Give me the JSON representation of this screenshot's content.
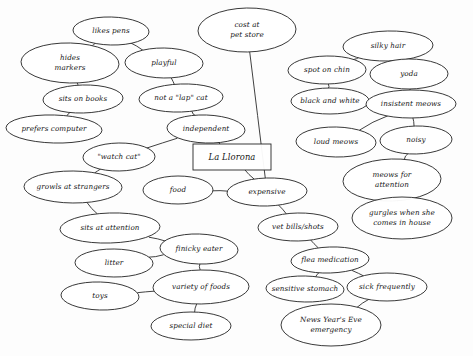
{
  "diagram": {
    "type": "mind-map",
    "style": "hand-drawn ink on paper",
    "background_color": "#fdfdfd",
    "ink_color": "#242424",
    "root": {
      "id": "la-llorona",
      "label": "La Llorona",
      "shape": "rectangle",
      "x": 232,
      "y": 157,
      "w": 78,
      "h": 26
    },
    "nodes": [
      {
        "id": "likes-pens",
        "label": "likes pens",
        "x": 111,
        "y": 31,
        "rx": 38,
        "ry": 14,
        "lines": [
          "likes pens"
        ]
      },
      {
        "id": "hides-markers",
        "label": "hides markers",
        "x": 70,
        "y": 63,
        "rx": 49,
        "ry": 20,
        "lines": [
          "hides",
          "markers"
        ]
      },
      {
        "id": "playful",
        "label": "playful",
        "x": 164,
        "y": 63,
        "rx": 39,
        "ry": 15,
        "lines": [
          "playful"
        ]
      },
      {
        "id": "cost-at-pet-store",
        "label": "cost at pet store",
        "x": 247,
        "y": 30,
        "rx": 49,
        "ry": 22,
        "lines": [
          "cost at",
          "pet store"
        ]
      },
      {
        "id": "silky-hair",
        "label": "silky hair",
        "x": 388,
        "y": 46,
        "rx": 45,
        "ry": 15,
        "lines": [
          "silky hair"
        ]
      },
      {
        "id": "spot-on-chin",
        "label": "spot on chin",
        "x": 327,
        "y": 70,
        "rx": 39,
        "ry": 14,
        "lines": [
          "spot on chin"
        ]
      },
      {
        "id": "yoda",
        "label": "yoda",
        "x": 409,
        "y": 74,
        "rx": 39,
        "ry": 15,
        "lines": [
          "yoda"
        ]
      },
      {
        "id": "sits-on-books",
        "label": "sits on books",
        "x": 83,
        "y": 99,
        "rx": 40,
        "ry": 14,
        "lines": [
          "sits on books"
        ]
      },
      {
        "id": "not-a-lap-cat",
        "label": "not a \"lap\" cat",
        "x": 181,
        "y": 98,
        "rx": 42,
        "ry": 14,
        "lines": [
          "not a \"lap\" cat"
        ]
      },
      {
        "id": "black-and-white",
        "label": "black and white",
        "x": 330,
        "y": 101,
        "rx": 39,
        "ry": 13,
        "lines": [
          "black and white"
        ]
      },
      {
        "id": "insistent-meows",
        "label": "insistent meows",
        "x": 411,
        "y": 104,
        "rx": 45,
        "ry": 14,
        "lines": [
          "insistent meows"
        ]
      },
      {
        "id": "prefers-computer",
        "label": "prefers computer",
        "x": 54,
        "y": 129,
        "rx": 48,
        "ry": 14,
        "lines": [
          "prefers computer"
        ]
      },
      {
        "id": "independent",
        "label": "independent",
        "x": 206,
        "y": 129,
        "rx": 39,
        "ry": 14,
        "lines": [
          "independent"
        ]
      },
      {
        "id": "loud-meows",
        "label": "loud meows",
        "x": 336,
        "y": 142,
        "rx": 40,
        "ry": 15,
        "lines": [
          "loud meows"
        ]
      },
      {
        "id": "noisy",
        "label": "noisy",
        "x": 416,
        "y": 140,
        "rx": 36,
        "ry": 14,
        "lines": [
          "noisy"
        ]
      },
      {
        "id": "watch-cat",
        "label": "\"watch cat\"",
        "x": 119,
        "y": 157,
        "rx": 36,
        "ry": 14,
        "lines": [
          "\"watch cat\""
        ]
      },
      {
        "id": "meows-for-attention",
        "label": "meows for attention",
        "x": 392,
        "y": 180,
        "rx": 49,
        "ry": 21,
        "lines": [
          "meows for",
          "attention"
        ]
      },
      {
        "id": "growls-at-strangers",
        "label": "growls at strangers",
        "x": 73,
        "y": 187,
        "rx": 49,
        "ry": 16,
        "lines": [
          "growls at strangers"
        ]
      },
      {
        "id": "food",
        "label": "food",
        "x": 178,
        "y": 190,
        "rx": 35,
        "ry": 14,
        "lines": [
          "food"
        ]
      },
      {
        "id": "expensive",
        "label": "expensive",
        "x": 267,
        "y": 192,
        "rx": 40,
        "ry": 14,
        "lines": [
          "expensive"
        ]
      },
      {
        "id": "vet-bills-shots",
        "label": "vet bills/shots",
        "x": 298,
        "y": 227,
        "rx": 40,
        "ry": 14,
        "lines": [
          "vet bills/shots"
        ]
      },
      {
        "id": "gurgles-when-she-comes",
        "label": "gurgles when she comes in house",
        "x": 402,
        "y": 218,
        "rx": 50,
        "ry": 21,
        "lines": [
          "gurgles when she",
          "comes in house"
        ]
      },
      {
        "id": "sits-at-attention",
        "label": "sits at attention",
        "x": 110,
        "y": 228,
        "rx": 50,
        "ry": 15,
        "lines": [
          "sits at attention"
        ]
      },
      {
        "id": "finicky-eater",
        "label": "finicky eater",
        "x": 199,
        "y": 249,
        "rx": 39,
        "ry": 15,
        "lines": [
          "finicky eater"
        ]
      },
      {
        "id": "flea-medication",
        "label": "flea medication",
        "x": 330,
        "y": 260,
        "rx": 39,
        "ry": 13,
        "lines": [
          "flea medication"
        ]
      },
      {
        "id": "litter",
        "label": "litter",
        "x": 114,
        "y": 263,
        "rx": 39,
        "ry": 14,
        "lines": [
          "litter"
        ]
      },
      {
        "id": "variety-of-foods",
        "label": "variety of foods",
        "x": 201,
        "y": 287,
        "rx": 48,
        "ry": 17,
        "lines": [
          "variety of foods"
        ]
      },
      {
        "id": "sensitive-stomach",
        "label": "sensitive stomach",
        "x": 305,
        "y": 289,
        "rx": 39,
        "ry": 13,
        "lines": [
          "sensitive stomach"
        ]
      },
      {
        "id": "sick-frequently",
        "label": "sick frequently",
        "x": 387,
        "y": 287,
        "rx": 40,
        "ry": 14,
        "lines": [
          "sick frequently"
        ]
      },
      {
        "id": "toys",
        "label": "toys",
        "x": 100,
        "y": 296,
        "rx": 39,
        "ry": 14,
        "lines": [
          "toys"
        ]
      },
      {
        "id": "special-diet",
        "label": "special diet",
        "x": 191,
        "y": 326,
        "rx": 40,
        "ry": 14,
        "lines": [
          "special diet"
        ]
      },
      {
        "id": "news-years-eve",
        "label": "News Year's Eve emergency",
        "x": 331,
        "y": 325,
        "rx": 50,
        "ry": 21,
        "lines": [
          "News Year's Eve",
          "emergency"
        ]
      }
    ],
    "edges": [
      {
        "from": "likes-pens",
        "to": "hides-markers"
      },
      {
        "from": "likes-pens",
        "to": "playful"
      },
      {
        "from": "hides-markers",
        "to": "sits-on-books"
      },
      {
        "from": "sits-on-books",
        "to": "prefers-computer"
      },
      {
        "from": "playful",
        "to": "not-a-lap-cat"
      },
      {
        "from": "not-a-lap-cat",
        "to": "independent"
      },
      {
        "from": "independent",
        "to": "la-llorona"
      },
      {
        "from": "independent",
        "to": "watch-cat"
      },
      {
        "from": "watch-cat",
        "to": "growls-at-strangers"
      },
      {
        "from": "growls-at-strangers",
        "to": "sits-at-attention"
      },
      {
        "from": "sits-at-attention",
        "to": "finicky-eater"
      },
      {
        "from": "litter",
        "to": "finicky-eater"
      },
      {
        "from": "finicky-eater",
        "to": "variety-of-foods"
      },
      {
        "from": "toys",
        "to": "variety-of-foods"
      },
      {
        "from": "variety-of-foods",
        "to": "special-diet"
      },
      {
        "from": "la-llorona",
        "to": "expensive"
      },
      {
        "from": "food",
        "to": "expensive"
      },
      {
        "from": "cost-at-pet-store",
        "to": "expensive"
      },
      {
        "from": "expensive",
        "to": "vet-bills-shots"
      },
      {
        "from": "vet-bills-shots",
        "to": "flea-medication"
      },
      {
        "from": "flea-medication",
        "to": "sensitive-stomach"
      },
      {
        "from": "flea-medication",
        "to": "sick-frequently"
      },
      {
        "from": "sick-frequently",
        "to": "news-years-eve"
      },
      {
        "from": "silky-hair",
        "to": "spot-on-chin"
      },
      {
        "from": "silky-hair",
        "to": "yoda"
      },
      {
        "from": "spot-on-chin",
        "to": "black-and-white"
      },
      {
        "from": "yoda",
        "to": "insistent-meows"
      },
      {
        "from": "black-and-white",
        "to": "insistent-meows"
      },
      {
        "from": "insistent-meows",
        "to": "loud-meows"
      },
      {
        "from": "insistent-meows",
        "to": "noisy"
      },
      {
        "from": "noisy",
        "to": "meows-for-attention"
      },
      {
        "from": "meows-for-attention",
        "to": "gurgles-when-she-comes"
      }
    ]
  }
}
